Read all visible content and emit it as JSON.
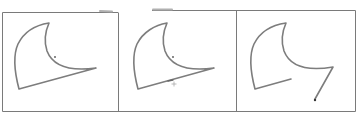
{
  "figure": {
    "panel_count": 3,
    "colors": {
      "background": "#ffffff",
      "frame": "#9a9a9a",
      "stroke": "#7d7d7d",
      "marker": "#555555"
    },
    "panels": [
      {
        "id": "panel-1",
        "state": "closed-shape",
        "markers": [
          "center-dot"
        ]
      },
      {
        "id": "panel-2",
        "state": "closed-shape",
        "markers": [
          "center-dot",
          "plus-marker"
        ]
      },
      {
        "id": "panel-3",
        "state": "open-shape-with-extended-stroke",
        "markers": [
          "end-dot"
        ]
      }
    ]
  }
}
